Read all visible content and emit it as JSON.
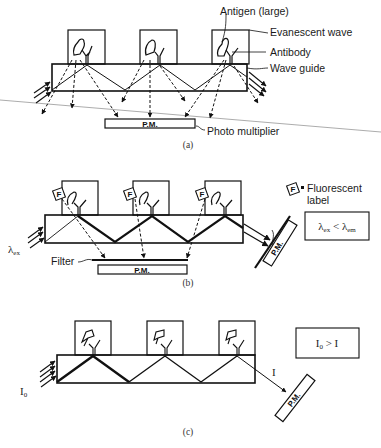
{
  "figure": {
    "panels": [
      {
        "id": "a",
        "caption": "(a)",
        "labels": {
          "antigen": "Antigen (large)",
          "evanescent_wave": "Evanescent wave",
          "antibody": "Antibody",
          "wave_guide": "Wave guide",
          "photo_multiplier": "Photo multiplier"
        },
        "pm_box": "P.M."
      },
      {
        "id": "b",
        "caption": "(b)",
        "legend": {
          "symbol": "F",
          "equals": "=",
          "text_line1": "Fluorescent",
          "text_line2": "label"
        },
        "condition": {
          "lhs": "λ",
          "lhs_sub": "ex",
          "op": "<",
          "rhs": "λ",
          "rhs_sub": "em"
        },
        "input_label": "λ",
        "input_label_sub": "ex",
        "filter_label": "Filter",
        "pm_box": "P.M.",
        "pm_side": "P.M."
      },
      {
        "id": "c",
        "caption": "(c)",
        "condition": {
          "lhs": "I",
          "lhs_sub": "0",
          "op": ">",
          "rhs": "I"
        },
        "input_label": "I",
        "input_label_sub": "0",
        "output_label": "I",
        "pm_side": "P.M."
      }
    ]
  }
}
